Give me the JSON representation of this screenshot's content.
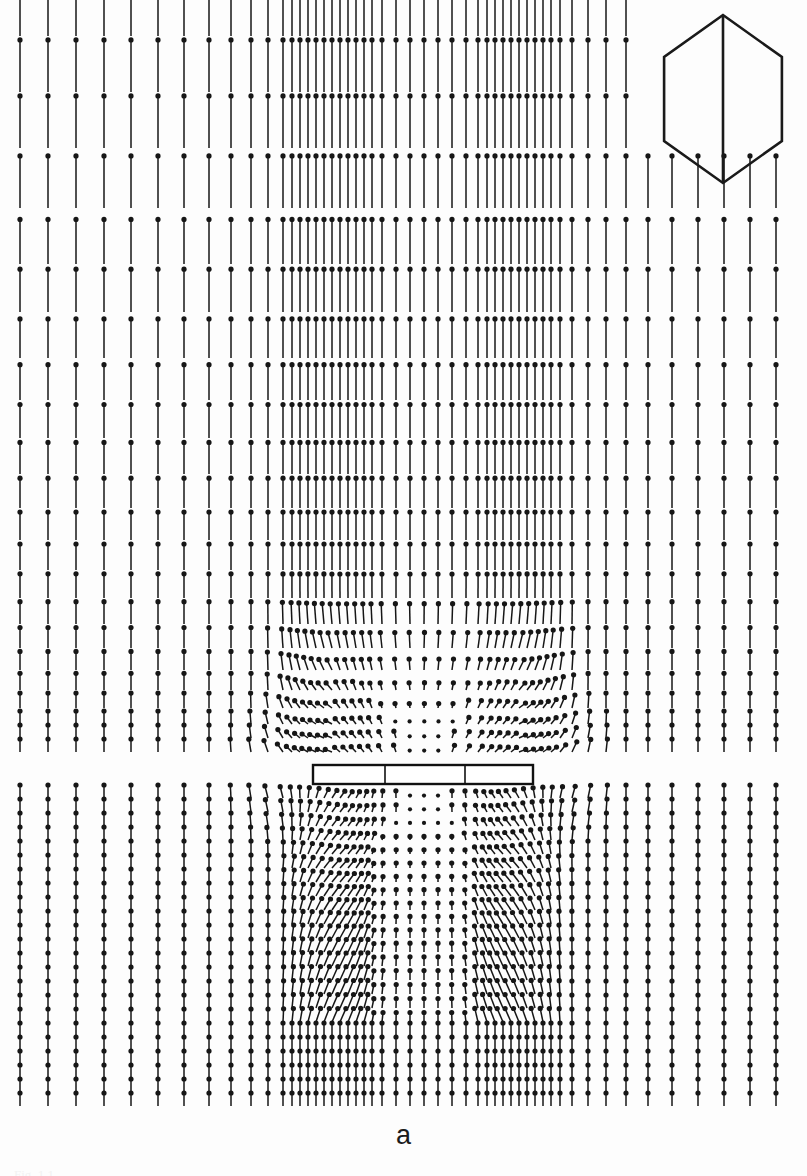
{
  "figure": {
    "panel_label": "a",
    "background_color": "#fdfdfd",
    "ink_color": "#161616",
    "width": 807,
    "height": 1176,
    "clipped_caption": "Fig. 1.1"
  },
  "inset": {
    "name": "hexagonal-domain-outline",
    "shape": "hexagon",
    "has_diagonal_chord": true,
    "stroke_color": "#1a1a1a",
    "stroke_width": 2.6,
    "center_x": 723,
    "center_y": 99,
    "radius_x": 68,
    "radius_y": 84,
    "chord_from_vertex": 3,
    "chord_to_vertex": 0
  },
  "body": {
    "name": "flat-plate-obstacle",
    "shape": "rectangle",
    "x": 313,
    "y": 765,
    "width": 220,
    "height": 19,
    "stroke_color": "#111111",
    "stroke_width": 2.4,
    "fill": "#ffffff",
    "divider_offsets": [
      72,
      152
    ]
  },
  "chart_data": {
    "type": "scatter",
    "title": "",
    "subtitle": "",
    "xlabel": "",
    "ylabel": "",
    "plot_kind": "vector-field-quiver",
    "glyph": {
      "style": "arrow-with-head",
      "head_shape": "filled-diamond",
      "head_size_px": 5.2,
      "shaft_width_px": 1.5,
      "direction_convention": "arrowhead marks the vector tip"
    },
    "axis_ranges": {
      "x": [
        14,
        793
      ],
      "y": [
        20,
        1112
      ]
    },
    "grid": false,
    "legend": null,
    "freestream": {
      "direction_degrees": 90,
      "reference_length_px": 46,
      "note": "uniform upward flow far from the body"
    },
    "columns": {
      "x_positions": [
        20,
        48,
        76,
        104,
        131,
        158,
        184,
        209,
        231,
        251,
        268,
        283,
        292,
        300,
        308,
        316,
        324,
        332,
        340,
        348,
        356,
        364,
        372,
        382,
        396,
        410,
        424,
        438,
        452,
        466,
        478,
        487,
        495,
        503,
        511,
        519,
        527,
        535,
        543,
        551,
        560,
        572,
        588,
        606,
        626,
        648,
        672,
        698,
        724,
        750,
        776
      ],
      "dense_cluster_left": [
        283,
        372
      ],
      "sparse_center": [
        382,
        466
      ],
      "dense_cluster_right": [
        478,
        560
      ],
      "note": "non-uniform mesh: refined near the plate edges, coarse at the far field"
    },
    "rows": {
      "y_positions": [
        36,
        92,
        148,
        208,
        264,
        312,
        358,
        400,
        438,
        474,
        508,
        540,
        570,
        598,
        624,
        648,
        670,
        690,
        708,
        724,
        738,
        752,
        798,
        812,
        826,
        840,
        854,
        868,
        882,
        896,
        910,
        924,
        938,
        952,
        966,
        980,
        994,
        1008,
        1022,
        1036,
        1050,
        1064,
        1078,
        1092,
        1106
      ],
      "note": "row spacing compresses with depth; rows 1-3 truncated on the right where the hexagon inset sits"
    },
    "regions": [
      {
        "name": "uniform-upstream",
        "y_range": [
          20,
          600
        ],
        "x_range": [
          14,
          793
        ],
        "mean_direction_degrees": 90,
        "mean_magnitude_normalized": 1.0
      },
      {
        "name": "stagnation-zone-above-plate",
        "y_range": [
          600,
          765
        ],
        "x_range": [
          300,
          545
        ],
        "mean_direction_degrees": 90,
        "mean_magnitude_normalized": 0.12,
        "note": "vectors collapse to dots as flow decelerates against the plate"
      },
      {
        "name": "left-shear-layer",
        "y_range": [
          620,
          780
        ],
        "x_range": [
          268,
          340
        ],
        "mean_direction_degrees": 140,
        "mean_magnitude_normalized": 0.55
      },
      {
        "name": "right-shear-layer",
        "y_range": [
          620,
          780
        ],
        "x_range": [
          505,
          580
        ],
        "mean_direction_degrees": 40,
        "mean_magnitude_normalized": 0.55
      },
      {
        "name": "wake-recirculation-left",
        "y_range": [
          790,
          990
        ],
        "x_range": [
          275,
          400
        ],
        "mean_direction_degrees": 30,
        "mean_magnitude_normalized": 0.6
      },
      {
        "name": "wake-recirculation-right",
        "y_range": [
          790,
          990
        ],
        "x_range": [
          460,
          590
        ],
        "mean_direction_degrees": 150,
        "mean_magnitude_normalized": 0.6
      },
      {
        "name": "wake-core-low-speed",
        "y_range": [
          790,
          980
        ],
        "x_range": [
          400,
          470
        ],
        "mean_direction_degrees": 90,
        "mean_magnitude_normalized": 0.2
      },
      {
        "name": "downstream-recovery",
        "y_range": [
          980,
          1112
        ],
        "x_range": [
          14,
          793
        ],
        "mean_direction_degrees": 90,
        "mean_magnitude_normalized": 0.85
      }
    ]
  }
}
